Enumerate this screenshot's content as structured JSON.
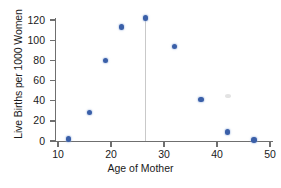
{
  "chart_data": {
    "type": "scatter",
    "title": "",
    "xlabel": "Age of Mother",
    "ylabel": "Live Births per 1000 Women",
    "xlim": [
      8,
      52
    ],
    "ylim": [
      -6,
      130
    ],
    "xticks": [
      10,
      20,
      30,
      40,
      50
    ],
    "yticks": [
      0,
      20,
      40,
      60,
      80,
      100,
      120
    ],
    "xtick_labels": [
      "10",
      "20",
      "30",
      "40",
      "50"
    ],
    "ytick_labels": [
      "0",
      "20",
      "40",
      "60",
      "80",
      "100",
      "120"
    ],
    "grid": false,
    "legend": null,
    "marker_color": "#3a5fa8",
    "axis_color": "#6f6f6f",
    "points": [
      {
        "x": 12,
        "y": 2
      },
      {
        "x": 16,
        "y": 28
      },
      {
        "x": 19,
        "y": 80
      },
      {
        "x": 22,
        "y": 113
      },
      {
        "x": 26.5,
        "y": 122
      },
      {
        "x": 32,
        "y": 94
      },
      {
        "x": 37,
        "y": 41
      },
      {
        "x": 42,
        "y": 9
      },
      {
        "x": 47,
        "y": 1
      }
    ],
    "annotations": [
      {
        "name": "peak-reference-line",
        "type": "vline",
        "x": 26.5,
        "y_from": 0,
        "y_to": 122,
        "color": "#c9c9c9"
      },
      {
        "name": "scan-artifact-smudge",
        "type": "smudge",
        "x": 42,
        "y": 45,
        "color": "#d8d8d8"
      }
    ]
  }
}
